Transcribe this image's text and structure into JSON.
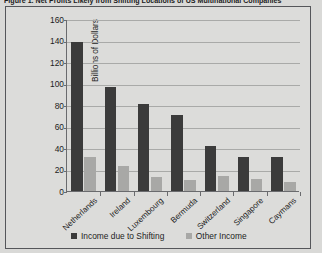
{
  "figure": {
    "caption": "Figure 1. Net Profits Likely from Shifting Locations of US Multinational Companies"
  },
  "chart_data": {
    "type": "bar",
    "title": "",
    "xlabel": "",
    "ylabel": "Billions of Dollars",
    "categories": [
      "Netherlands",
      "Ireland",
      "Luxembourg",
      "Bermuda",
      "Switzerland",
      "Singapore",
      "Caymans"
    ],
    "series": [
      {
        "name": "Income due to Shifting",
        "color": "#3b3b3b",
        "values": [
          139,
          97,
          81,
          71,
          42,
          32,
          32
        ]
      },
      {
        "name": "Other Income",
        "color": "#a8a8a6",
        "values": [
          32,
          23,
          13,
          10,
          14,
          11,
          8
        ]
      }
    ],
    "ylim": [
      0,
      160
    ],
    "yticks": [
      0,
      20,
      40,
      60,
      80,
      100,
      120,
      140,
      160
    ],
    "grid": true,
    "legend_position": "bottom"
  }
}
